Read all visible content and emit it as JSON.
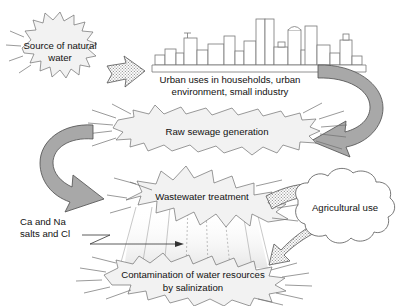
{
  "diagram": {
    "background_color": "#ffffff",
    "nodes": {
      "source": {
        "id": "source-of-natural-water",
        "shape": "starburst",
        "line1": "Source of natural",
        "line2": "water"
      },
      "urban": {
        "id": "urban-uses",
        "shape": "skyline-caption",
        "line1": "Urban uses in households, urban",
        "line2": "environment, small industry"
      },
      "raw_sewage": {
        "id": "raw-sewage-generation",
        "shape": "starburst",
        "line1": "Raw sewage generation"
      },
      "wastewater": {
        "id": "wastewater-treatment",
        "shape": "starburst",
        "line1": "Wastewater treatment"
      },
      "agricultural": {
        "id": "agricultural-use",
        "shape": "cloud",
        "line1": "Agricultural use"
      },
      "contamination": {
        "id": "contamination-by-salinization",
        "shape": "starburst",
        "line1": "Contamination of water resources",
        "line2": "by salinization"
      },
      "salts": {
        "id": "salts-annotation",
        "shape": "text-with-leader",
        "line1": "Ca and Na",
        "line2": "salts and Cl"
      }
    },
    "arrows": [
      {
        "id": "source-to-urban",
        "from": "source-of-natural-water",
        "to": "urban-uses",
        "style": "stippled",
        "direction": "right"
      },
      {
        "id": "urban-to-raw-sewage",
        "from": "urban-uses",
        "to": "raw-sewage-generation",
        "style": "curved-gradient",
        "direction": "right-down-left"
      },
      {
        "id": "raw-sewage-to-wastewater",
        "from": "raw-sewage-generation",
        "to": "wastewater-treatment",
        "style": "curved-gradient",
        "direction": "left-down-right"
      },
      {
        "id": "wastewater-to-agricultural",
        "from": "wastewater-treatment",
        "to": "agricultural-use",
        "style": "stippled",
        "direction": "up-right"
      },
      {
        "id": "agricultural-to-contamination",
        "from": "agricultural-use",
        "to": "contamination-by-salinization",
        "style": "stippled",
        "direction": "down-left"
      },
      {
        "id": "salts-to-contamination",
        "from": "salts-annotation",
        "to": "contamination-by-salinization",
        "style": "thin-line",
        "direction": "right"
      }
    ],
    "colors": {
      "burst_fill": "#f2f2f2",
      "burst_stroke": "#6e6e6e",
      "arrow_gray": "#a8a8a8",
      "arrow_light": "#ebebeb",
      "text": "#111111",
      "building_stroke": "#777777"
    }
  }
}
